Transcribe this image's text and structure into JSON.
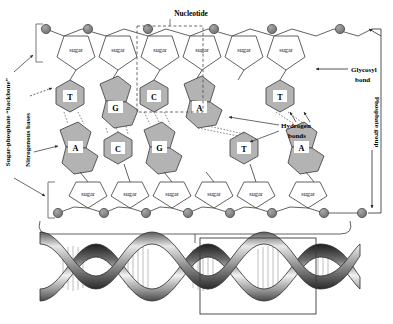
{
  "figure": {
    "background_color": "#ffffff",
    "line_color": "#3a3a3a",
    "base_fill_color": "#b3b3b3",
    "phosphate_fill_color": "#8a8a8a",
    "sugar_fill_color": "#ffffff",
    "label_color": "#000000"
  },
  "labels": {
    "nucleotide": "Nucleotide",
    "glycosyl_bond": "Glycosyl\nbond",
    "glycosyl_bond_line1": "Glycosyl",
    "glycosyl_bond_line2": "bond",
    "phosphate_group": "Phosphate group",
    "hydrogen_bonds_line1": "Hydrogen",
    "hydrogen_bonds_line2": "bonds",
    "sugar_phosphate_backbone": "Sugar-phosphate “backbone”",
    "nitrogenous_bases": "Nitrogenous bases"
  },
  "sugar_label": "sugar",
  "strands": {
    "top": {
      "name": "top-strand",
      "bases": [
        {
          "letter": "T",
          "type": "pyrimidine"
        },
        {
          "letter": "G",
          "type": "purine"
        },
        {
          "letter": "C",
          "type": "pyrimidine"
        },
        {
          "letter": "A",
          "type": "purine"
        },
        {
          "letter": "T",
          "type": "pyrimidine"
        }
      ],
      "sugar_count": 5,
      "phosphate_count": 6
    },
    "bottom": {
      "name": "bottom-strand",
      "bases": [
        {
          "letter": "A",
          "type": "purine"
        },
        {
          "letter": "C",
          "type": "pyrimidine"
        },
        {
          "letter": "G",
          "type": "purine"
        },
        {
          "letter": "T",
          "type": "pyrimidine"
        },
        {
          "letter": "A",
          "type": "purine"
        }
      ],
      "sugar_count": 5,
      "phosphate_count": 6
    }
  },
  "base_pairs": [
    {
      "top": "T",
      "bottom": "A",
      "hydrogen_bonds": 2
    },
    {
      "top": "G",
      "bottom": "C",
      "hydrogen_bonds": 3
    },
    {
      "top": "C",
      "bottom": "G",
      "hydrogen_bonds": 3
    },
    {
      "top": "A",
      "bottom": "T",
      "hydrogen_bonds": 2
    },
    {
      "top": "T",
      "bottom": "A",
      "hydrogen_bonds": 2
    }
  ],
  "helix": {
    "name": "dna-double-helix",
    "turns": 3,
    "highlight_box": true,
    "rung_groups": 4
  }
}
